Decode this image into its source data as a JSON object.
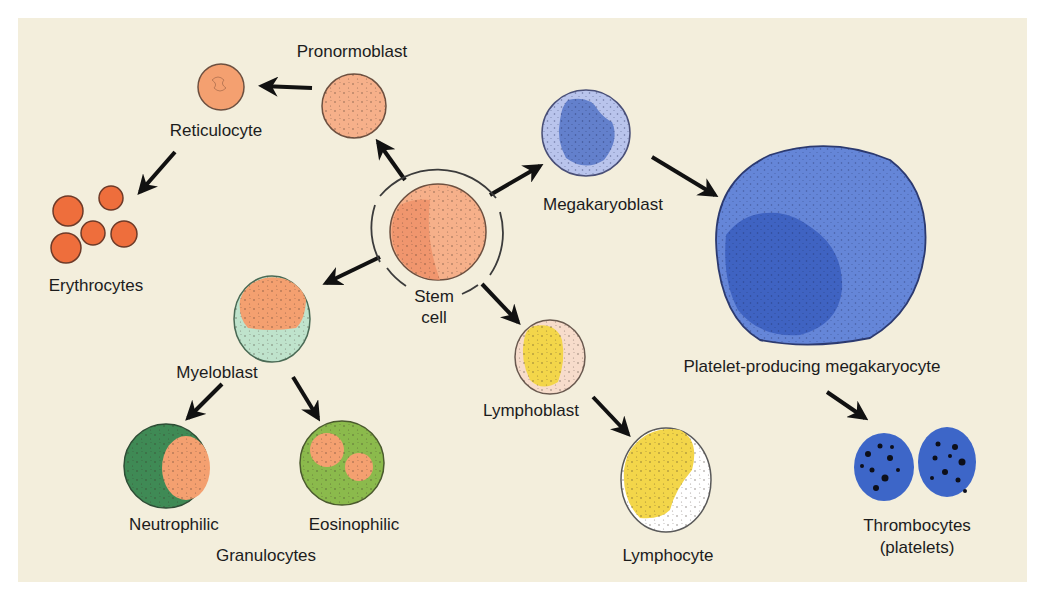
{
  "colors": {
    "background": "#f3eedc",
    "outline": "#4a4038",
    "erythroid": "#f4a37a",
    "erythroid_dark": "#ee7a4e",
    "myeloblast_cytoplasm": "#bfe3cc",
    "neutrophil_cytoplasm": "#3f8a55",
    "eosinophil_cytoplasm": "#8bba4c",
    "megakaryoblast_cytoplasm": "#b9c4ec",
    "megakaryoblast_nucleus": "#6380cc",
    "megakaryocyte_cytoplasm": "#6586d8",
    "megakaryocyte_nucleus": "#3f63c2",
    "platelet": "#3d66c8",
    "lymph_nucleus": "#f3d64a",
    "lymphoblast_cytoplasm": "#f7dccb",
    "lymphocyte_cytoplasm": "#ffffff",
    "arrow": "#111111"
  },
  "labels": {
    "stem_cell_line1": "Stem",
    "stem_cell_line2": "cell",
    "pronormoblast": "Pronormoblast",
    "reticulocyte": "Reticulocyte",
    "erythrocytes": "Erythrocytes",
    "myeloblast": "Myeloblast",
    "neutrophilic": "Neutrophilic",
    "eosinophilic": "Eosinophilic",
    "granulocytes": "Granulocytes",
    "megakaryoblast": "Megakaryoblast",
    "megakaryocyte": "Platelet-producing megakaryocyte",
    "lymphoblast": "Lymphoblast",
    "lymphocyte": "Lymphocyte",
    "thrombocytes_line1": "Thrombocytes",
    "thrombocytes_line2": "(platelets)"
  },
  "lineages": [
    {
      "name": "Erythroid",
      "stages": [
        "Stem cell",
        "Pronormoblast",
        "Reticulocyte",
        "Erythrocytes"
      ]
    },
    {
      "name": "Myeloid",
      "stages": [
        "Stem cell",
        "Myeloblast",
        "Neutrophilic / Eosinophilic granulocytes"
      ]
    },
    {
      "name": "Megakaryocytic",
      "stages": [
        "Stem cell",
        "Megakaryoblast",
        "Platelet-producing megakaryocyte",
        "Thrombocytes (platelets)"
      ]
    },
    {
      "name": "Lymphoid",
      "stages": [
        "Stem cell",
        "Lymphoblast",
        "Lymphocyte"
      ]
    }
  ]
}
